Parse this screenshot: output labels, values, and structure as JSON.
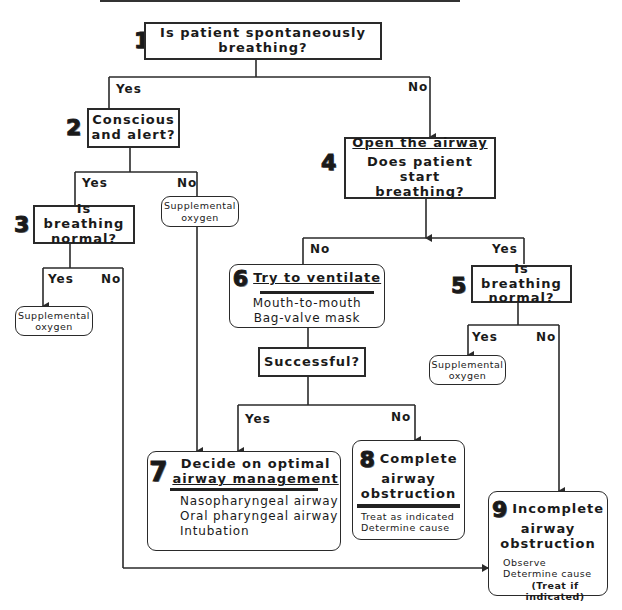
{
  "header": {
    "title_cropped": ""
  },
  "nodes": {
    "n1": {
      "num": "1",
      "text": "Is patient spontaneously breathing?"
    },
    "n2": {
      "num": "2",
      "line1": "Conscious",
      "line2": "and alert?"
    },
    "n2_no_action": {
      "line1": "Supplemental",
      "line2": "oxygen"
    },
    "n3": {
      "num": "3",
      "line1": "Is breathing",
      "line2": "normal?"
    },
    "n3_yes_action": {
      "line1": "Supplemental",
      "line2": "oxygen"
    },
    "n4": {
      "num": "4",
      "heading": "Open the airway",
      "line1": "Does patient start",
      "line2": "breathing?"
    },
    "n5": {
      "num": "5",
      "line1": "Is breathing",
      "line2": "normal?"
    },
    "n5_yes_action": {
      "line1": "Supplemental",
      "line2": "oxygen"
    },
    "n6": {
      "num": "6",
      "heading": "Try to ventilate",
      "items": [
        "Mouth-to-mouth",
        "Bag-valve mask"
      ]
    },
    "successful": {
      "text": "Successful?"
    },
    "n7": {
      "num": "7",
      "heading1": "Decide on optimal",
      "heading2": "airway management",
      "items": [
        "Nasopharyngeal airway",
        "Oral pharyngeal airway",
        "Intubation"
      ]
    },
    "n8": {
      "num": "8",
      "heading1": "Complete",
      "heading2": "airway",
      "heading3": "obstruction",
      "items": [
        "Treat as indicated",
        "Determine cause"
      ]
    },
    "n9": {
      "num": "9",
      "heading1": "Incomplete",
      "heading2": "airway",
      "heading3": "obstruction",
      "items": [
        "Observe",
        "Determine cause",
        "(Treat if indicated)"
      ]
    }
  },
  "edge_labels": {
    "n1_yes": "Yes",
    "n1_no": "No",
    "n2_yes": "Yes",
    "n2_no": "No",
    "n3_yes": "Yes",
    "n3_no": "No",
    "n4_no": "No",
    "n4_yes": "Yes",
    "n5_yes": "Yes",
    "n5_no": "No",
    "succ_yes": "Yes",
    "succ_no": "No"
  },
  "colors": {
    "line": "#2a2a2a",
    "background": "#ffffff"
  }
}
